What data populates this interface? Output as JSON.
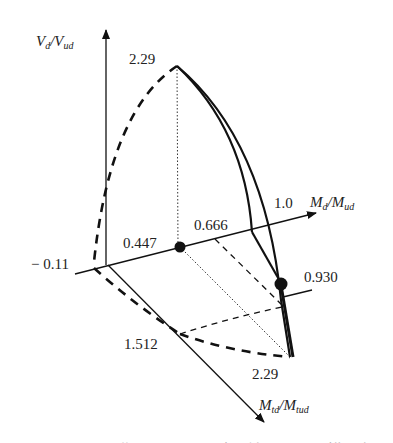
{
  "diagram": {
    "type": "3d-interaction-surface",
    "axes": {
      "vertical": {
        "num": "V",
        "num_sub": "d",
        "den": "V",
        "den_sub": "ud"
      },
      "right": {
        "num": "M",
        "num_sub": "d",
        "den": "M",
        "den_sub": "ud"
      },
      "front": {
        "num": "M",
        "num_sub": "td",
        "den": "M",
        "den_sub": "tud"
      }
    },
    "labels": {
      "top_value": "2.29",
      "front_max": "2.29",
      "right_one": "1.0",
      "right_0666": "0.666",
      "right_0447": "0.447",
      "neg": "− 0.11",
      "front_1512": "1.512",
      "pt_0930": "0.930"
    },
    "caption_partial": "图 ········ 曲 目 ······· 相 关 ······· 模 型"
  },
  "colors": {
    "stroke": "#111111",
    "text": "#222222",
    "background": "#ffffff"
  }
}
